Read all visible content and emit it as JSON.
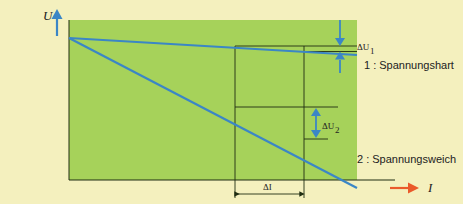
{
  "diagram": {
    "type": "voltage-current characteristic",
    "axis_y_label": "U",
    "axis_x_label": "I",
    "colors": {
      "background": "#f4f0be",
      "plot_area": "#a6d25a",
      "curve": "#3b86c6",
      "y_axis_arrow": "#3b86c6",
      "x_axis_arrow": "#ea5a2a",
      "guide_lines": "#1f2d12"
    },
    "curves": [
      {
        "id": 1,
        "label": "1 : Spannungshart",
        "delta_label": "ΔU",
        "delta_sub": "1"
      },
      {
        "id": 2,
        "label": "2 : Spannungsweich",
        "delta_label": "ΔU",
        "delta_sub": "2"
      }
    ],
    "delta_i_label": "ΔI"
  }
}
